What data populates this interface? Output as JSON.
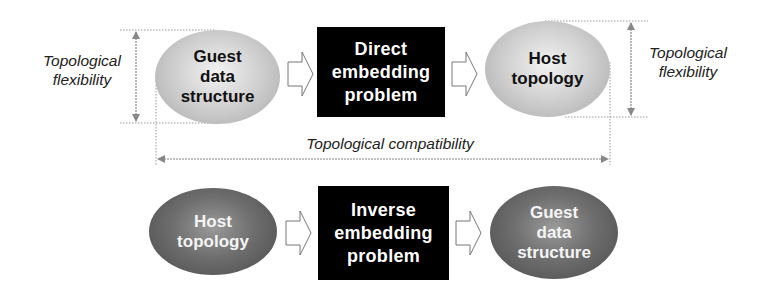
{
  "diagram": {
    "top_row": {
      "source": {
        "text": "Guest\ndata\nstructure",
        "shade": "light"
      },
      "process": {
        "text": "Direct\nembedding\nproblem"
      },
      "target": {
        "text": "Host\ntopology",
        "shade": "light"
      }
    },
    "bottom_row": {
      "source": {
        "text": "Host\ntopology",
        "shade": "dark"
      },
      "process": {
        "text": "Inverse\nembedding\nproblem"
      },
      "target": {
        "text": "Guest\ndata\nstructure",
        "shade": "dark"
      }
    },
    "annotations": {
      "left_flexibility": "Topological\nflexibility",
      "right_flexibility": "Topological\nflexibility",
      "compatibility": "Topological compatibility"
    },
    "colors": {
      "box_fill": "#000000",
      "box_text": "#ffffff",
      "dimension_line": "#888888",
      "light_ellipse": "#c8c8c8",
      "dark_ellipse": "#666666"
    }
  }
}
